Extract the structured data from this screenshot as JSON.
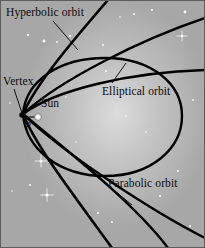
{
  "figure": {
    "background_color": "#a9a9a9",
    "glow_color": "#d8d8d8",
    "curve_color": "#000000",
    "text_color": "#0a0a0a",
    "star_color": "#ffffff",
    "width": 205,
    "height": 248
  },
  "labels": {
    "hyperbolic": "Hyperbolic orbit",
    "vertex": "Vertex",
    "sun": "Sun",
    "perihelion": "p",
    "elliptical": "Elliptical orbit",
    "parabolic": "Parabolic orbit"
  },
  "markers": {
    "vertex_point": {
      "x": 22,
      "y": 115
    },
    "sun_point": {
      "x": 38,
      "y": 117
    },
    "perihelion_segment": {
      "x1": 22,
      "y1": 117,
      "x2": 38,
      "y2": 117
    }
  },
  "chart_data": {
    "type": "line",
    "xlabel": "",
    "ylabel": "",
    "grid": false,
    "legend": "inline-annotations",
    "series": [
      {
        "name": "Hyperbolic orbit",
        "description": "Open conic, eccentricity greater than 1, both branches diverge steeply from the shared vertex",
        "eccentricity": ">1",
        "path": "M 108 0 C 70 44 36 84 23 114 C 36 146 70 190 112 248"
      },
      {
        "name": "Parabolic orbit",
        "description": "Open conic, eccentricity equal to 1, arms widen more gradually than the hyperbola",
        "eccentricity": "1",
        "path": "M 205 18 C 140 40 60 80 23 114 C 62 152 150 210 205 238"
      },
      {
        "name": "Second hyperbolic branch",
        "description": "Intermediate open conic between the parabola and the steep hyperbola",
        "eccentricity": ">1",
        "path": "M 205 70 C 130 72 55 90 23 114 C 56 142 132 200 168 248"
      },
      {
        "name": "Elliptical orbit",
        "description": "Closed conic, eccentricity less than 1, with the Sun at the near focus and the vertex at perihelion",
        "eccentricity": "<1",
        "path": "M 23 114 C 26 80 60 58 105 58 C 152 58 182 84 182 116 C 182 148 152 176 105 176 C 60 176 26 150 23 114 Z"
      }
    ],
    "annotations": [
      {
        "text": "Hyperbolic orbit",
        "leader_from": {
          "x": 53,
          "y": 21
        },
        "leader_to": {
          "x": 78,
          "y": 50
        }
      },
      {
        "text": "Vertex",
        "leader_from": {
          "x": 14,
          "y": 89
        },
        "leader_to": {
          "x": 22,
          "y": 113
        }
      },
      {
        "text": "Elliptical orbit",
        "leader_from": {
          "x": 112,
          "y": 83
        },
        "leader_to": {
          "x": 126,
          "y": 63
        }
      },
      {
        "text": "Parabolic orbit",
        "leader_from": {
          "x": 115,
          "y": 191
        },
        "leader_to": {
          "x": 132,
          "y": 205
        }
      }
    ],
    "stars": [
      {
        "x": 28,
        "y": 35,
        "r": 1.1,
        "sparkle": false
      },
      {
        "x": 44,
        "y": 41,
        "r": 1.4,
        "sparkle": false
      },
      {
        "x": 57,
        "y": 42,
        "r": 0.9,
        "sparkle": false
      },
      {
        "x": 70,
        "y": 36,
        "r": 1.1,
        "sparkle": false
      },
      {
        "x": 120,
        "y": 17,
        "r": 0.8,
        "sparkle": false
      },
      {
        "x": 134,
        "y": 14,
        "r": 0.9,
        "sparkle": false
      },
      {
        "x": 152,
        "y": 10,
        "r": 1.0,
        "sparkle": false
      },
      {
        "x": 185,
        "y": 12,
        "r": 1.4,
        "sparkle": false
      },
      {
        "x": 182,
        "y": 36,
        "r": 1.3,
        "sparkle": true
      },
      {
        "x": 103,
        "y": 45,
        "r": 0.9,
        "sparkle": false
      },
      {
        "x": 10,
        "y": 103,
        "r": 0.8,
        "sparkle": false
      },
      {
        "x": 66,
        "y": 97,
        "r": 0.8,
        "sparkle": false
      },
      {
        "x": 106,
        "y": 71,
        "r": 0.9,
        "sparkle": false
      },
      {
        "x": 193,
        "y": 100,
        "r": 0.9,
        "sparkle": false
      },
      {
        "x": 126,
        "y": 116,
        "r": 0.8,
        "sparkle": false
      },
      {
        "x": 146,
        "y": 132,
        "r": 0.8,
        "sparkle": false
      },
      {
        "x": 41,
        "y": 161,
        "r": 1.5,
        "sparkle": true
      },
      {
        "x": 30,
        "y": 185,
        "r": 0.9,
        "sparkle": false
      },
      {
        "x": 47,
        "y": 195,
        "r": 1.6,
        "sparkle": true
      },
      {
        "x": 12,
        "y": 191,
        "r": 0.8,
        "sparkle": false
      },
      {
        "x": 98,
        "y": 213,
        "r": 1.1,
        "sparkle": false
      },
      {
        "x": 112,
        "y": 222,
        "r": 0.9,
        "sparkle": false
      },
      {
        "x": 160,
        "y": 196,
        "r": 1.0,
        "sparkle": false
      },
      {
        "x": 178,
        "y": 171,
        "r": 0.9,
        "sparkle": false
      },
      {
        "x": 190,
        "y": 226,
        "r": 1.0,
        "sparkle": false
      },
      {
        "x": 76,
        "y": 142,
        "r": 0.7,
        "sparkle": false
      }
    ]
  }
}
